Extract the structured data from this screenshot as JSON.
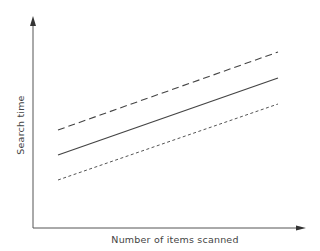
{
  "chart_data": {
    "type": "line",
    "title": "",
    "xlabel": "Number of items scanned",
    "ylabel": "Search time",
    "grid": false,
    "legend": null,
    "x_ticks": [],
    "y_ticks": [],
    "x": [
      0,
      1
    ],
    "series": [
      {
        "name": "upper (dashed)",
        "style": "dashed",
        "values": [
          0.46,
          0.83
        ]
      },
      {
        "name": "middle (solid)",
        "style": "solid",
        "values": [
          0.34,
          0.71
        ]
      },
      {
        "name": "lower (dotted)",
        "style": "dotted",
        "values": [
          0.23,
          0.59
        ]
      }
    ],
    "axis_ranges": {
      "x": [
        0,
        1.24
      ],
      "y": [
        0,
        1
      ]
    },
    "line_color": "#444444"
  },
  "axes": {
    "x_label": "Number of items scanned",
    "y_label": "Search time"
  },
  "geometry": {
    "origin": [
      33,
      228
    ],
    "y_axis_top": 17,
    "x_axis_right": 306,
    "lines": [
      {
        "name": "dashed",
        "x1": 58,
        "y1": 130,
        "x2": 278,
        "y2": 52,
        "dash": "7,4"
      },
      {
        "name": "solid",
        "x1": 58,
        "y1": 155,
        "x2": 278,
        "y2": 78,
        "dash": ""
      },
      {
        "name": "dotted",
        "x1": 58,
        "y1": 180,
        "x2": 278,
        "y2": 104,
        "dash": "3,2.5"
      }
    ]
  }
}
